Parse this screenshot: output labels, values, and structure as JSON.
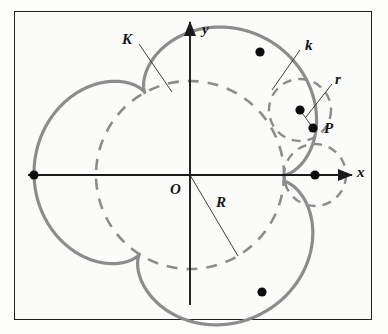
{
  "figure": {
    "type": "geometric-diagram",
    "background_color": "#fbfbf9",
    "border_color": "#231f20",
    "curve_color": "#8c8c8c",
    "axis_color": "#1a1a1a",
    "point_color": "#0d0d0d"
  },
  "axes": {
    "x_label": "x",
    "y_label": "y",
    "origin_label": "O",
    "origin": {
      "x": 190,
      "y": 175
    },
    "x_axis": {
      "start_x": 28,
      "end_x": 352,
      "y": 175,
      "arrow": true
    },
    "y_axis": {
      "x": 190,
      "start_y": 305,
      "end_y": 22,
      "arrow": true
    }
  },
  "labels": {
    "fixed_circle": "K",
    "rolling_circle": "k",
    "rolling_radius": "r",
    "tracing_point": "P",
    "fixed_radius": "R"
  },
  "label_positions": {
    "K": {
      "x": 122,
      "y": 38
    },
    "k": {
      "x": 305,
      "y": 44
    },
    "r": {
      "x": 335,
      "y": 78
    },
    "P": {
      "x": 325,
      "y": 121
    },
    "R": {
      "x": 218,
      "y": 197
    },
    "O": {
      "x": 172,
      "y": 183
    },
    "x": {
      "x": 358,
      "y": 165
    },
    "y": {
      "x": 203,
      "y": 24
    }
  },
  "fixed_circle_K": {
    "center": {
      "x": 190,
      "y": 175
    },
    "radius": 94,
    "style": "dashed",
    "stroke": "#8c8c8c",
    "stroke_width": 2.6,
    "dash_pattern": "11 9"
  },
  "rolling_circles": [
    {
      "name": "k-upper-right",
      "center": {
        "x": 300,
        "y": 110
      },
      "radius": 31,
      "style": "dashed",
      "stroke": "#8c8c8c",
      "stroke_width": 2.4,
      "dash_pattern": "9 7",
      "has_center_dot": true
    },
    {
      "name": "k-on-x-axis",
      "center": {
        "x": 315,
        "y": 175
      },
      "radius": 31,
      "style": "dashed",
      "stroke": "#8c8c8c",
      "stroke_width": 2.4,
      "dash_pattern": "9 7",
      "has_center_dot": true
    }
  ],
  "epicycloid": {
    "R": 94,
    "r": 31,
    "cusps": 3,
    "center": {
      "x": 190,
      "y": 175
    },
    "phase_deg": 0,
    "stroke": "#8c8c8c",
    "stroke_width": 3.2,
    "style": "solid"
  },
  "marked_points": [
    {
      "name": "cusp-left-on-x-axis",
      "x": 34,
      "y": 175,
      "label": ""
    },
    {
      "name": "point-P",
      "x": 313,
      "y": 128,
      "label": "P"
    },
    {
      "name": "rolling-circle-center-upper",
      "x": 300,
      "y": 110,
      "label": ""
    },
    {
      "name": "rolling-circle-center-x-axis",
      "x": 315,
      "y": 175,
      "label": ""
    },
    {
      "name": "curve-point-top-right",
      "x": 260,
      "y": 52,
      "label": ""
    },
    {
      "name": "curve-point-bottom-right",
      "x": 262,
      "y": 292,
      "label": ""
    }
  ],
  "leader_lines": [
    {
      "name": "leader-K",
      "from": {
        "x": 139,
        "y": 44
      },
      "to": {
        "x": 172,
        "y": 92
      },
      "target": "dashed-circle-K"
    },
    {
      "name": "leader-k",
      "from": {
        "x": 300,
        "y": 50
      },
      "to": {
        "x": 272,
        "y": 90
      },
      "target": "rolling-circle-k"
    },
    {
      "name": "leader-r",
      "from": {
        "x": 332,
        "y": 84
      },
      "to": {
        "x": 306,
        "y": 117
      },
      "target": "radius-r"
    },
    {
      "name": "radius-r-segment",
      "from": {
        "x": 300,
        "y": 110
      },
      "to": {
        "x": 313,
        "y": 128
      },
      "target": "P"
    },
    {
      "name": "radius-R-segment",
      "from": {
        "x": 190,
        "y": 175
      },
      "to": {
        "x": 238,
        "y": 256
      },
      "target": "circle-K"
    }
  ]
}
